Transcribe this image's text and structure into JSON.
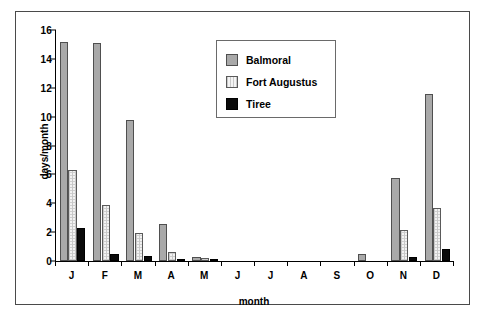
{
  "chart_data": {
    "type": "bar",
    "title": "",
    "xlabel": "month",
    "ylabel": "days/month",
    "categories": [
      "J",
      "F",
      "M",
      "A",
      "M",
      "J",
      "J",
      "A",
      "S",
      "O",
      "N",
      "D"
    ],
    "ylim": [
      0,
      16
    ],
    "ytick_values": [
      0,
      2,
      4,
      6,
      8,
      10,
      12,
      14,
      16
    ],
    "ytick_labels": [
      "0",
      "2",
      "4",
      "6",
      "8",
      "10",
      "12",
      "14",
      "16"
    ],
    "grid": false,
    "legend_position": "top-center-right",
    "series": [
      {
        "name": "Balmoral",
        "color": "#a9a9a9",
        "values": [
          15.2,
          15.1,
          9.75,
          2.55,
          0.25,
          0,
          0,
          0,
          0,
          0.5,
          5.75,
          11.6
        ]
      },
      {
        "name": "Fort Augustus",
        "color": "#f2f2f2",
        "values": [
          6.3,
          3.85,
          1.95,
          0.6,
          0.2,
          0,
          0,
          0,
          0,
          0,
          2.15,
          3.65
        ]
      },
      {
        "name": "Tiree",
        "color": "#0a0a0a",
        "values": [
          2.3,
          0.5,
          0.35,
          0.1,
          0.15,
          0,
          0,
          0,
          0,
          0,
          0.25,
          0.85
        ]
      }
    ]
  }
}
